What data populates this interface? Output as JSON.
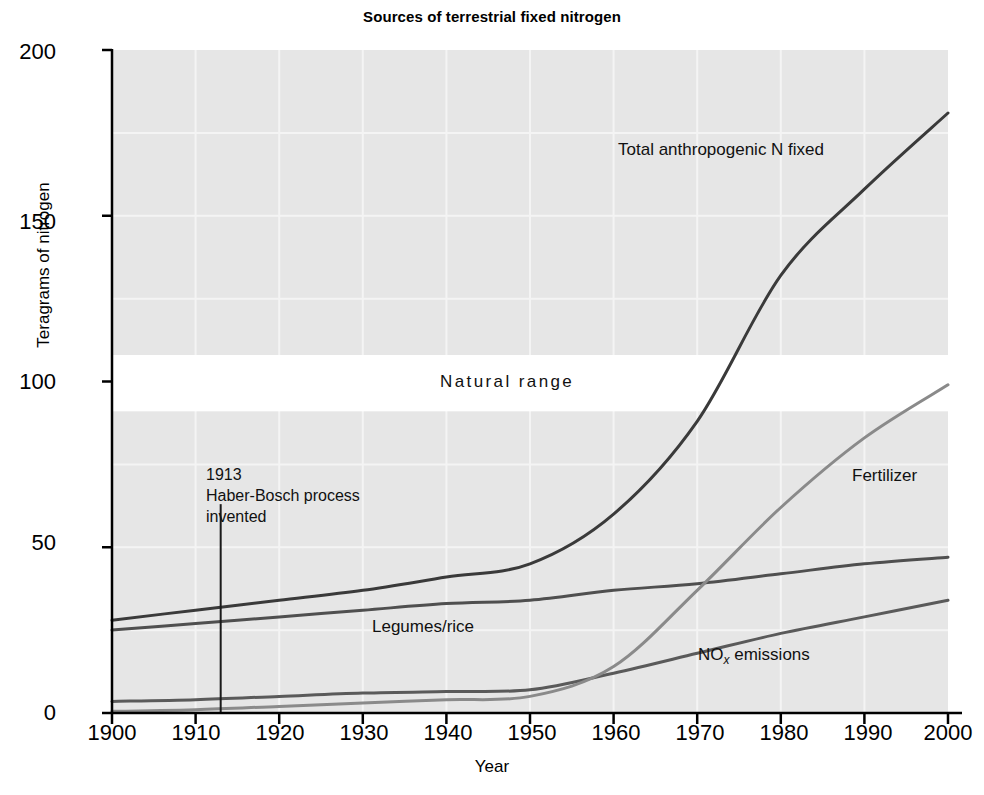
{
  "chart_data": {
    "type": "line",
    "title": "Sources of terrestrial fixed nitrogen",
    "xlabel": "Year",
    "ylabel": "Teragrams of nitrogen",
    "xlim": [
      1900,
      2000
    ],
    "ylim": [
      0,
      200
    ],
    "xticks": [
      "1900",
      "1910",
      "1920",
      "1930",
      "1940",
      "1950",
      "1960",
      "1970",
      "1980",
      "1990",
      "2000"
    ],
    "yticks": [
      "0",
      "50",
      "100",
      "150",
      "200"
    ],
    "grid": "light vertical and horizontal gridlines on gray plot background",
    "legend": "inline labels next to each curve",
    "x": [
      1900,
      1910,
      1920,
      1930,
      1940,
      1950,
      1960,
      1970,
      1980,
      1990,
      2000
    ],
    "series": [
      {
        "name": "Total anthropogenic N fixed",
        "color": "#3a3a3a",
        "values": [
          28,
          31,
          34,
          37,
          41,
          45,
          60,
          88,
          132,
          158,
          181
        ]
      },
      {
        "name": "Legumes/rice",
        "color": "#4f4f4f",
        "values": [
          25,
          27,
          29,
          31,
          33,
          34,
          37,
          39,
          42,
          45,
          47
        ]
      },
      {
        "name": "NOx emissions",
        "color": "#5a5a5a",
        "values": [
          3.5,
          4,
          5,
          6,
          6.5,
          7,
          12,
          18,
          24,
          29,
          34
        ]
      },
      {
        "name": "Fertilizer",
        "color": "#8a8a8a",
        "values": [
          0.5,
          1,
          2,
          3,
          4,
          5,
          14,
          37,
          62,
          83,
          99
        ]
      }
    ],
    "bands": [
      {
        "name": "Natural range",
        "label": "Natural range",
        "y_low": 91,
        "y_high": 108,
        "color": "#ffffff"
      }
    ],
    "annotations": [
      {
        "name": "haber-bosch",
        "year": 1913,
        "lines": [
          "1913",
          "Haber-Bosch process",
          "invented"
        ],
        "line_top_value": 63,
        "line_bottom_value": 0
      }
    ],
    "series_label_positions": [
      {
        "name": "Total anthropogenic N fixed",
        "x": 1963,
        "y": 152
      },
      {
        "name": "Fertilizer",
        "x": 1982,
        "y": 73
      },
      {
        "name": "Legumes/rice",
        "x": 1933,
        "y": 24
      },
      {
        "name": "NOx emissions",
        "x": 1971,
        "y": 15
      }
    ],
    "style": {
      "plot_background": "#e6e6e6",
      "gridline_color": "#f2f2f2",
      "axis_color": "#000000",
      "page_background": "#ffffff"
    }
  },
  "labels": {
    "title": "Sources of terrestrial fixed nitrogen",
    "ylabel": "Teragrams of nitrogen",
    "xlabel": "Year",
    "natural_range": "Natural range",
    "total": "Total anthropogenic N fixed",
    "fertilizer": "Fertilizer",
    "legumes": "Legumes/rice",
    "nox_prefix": "NO",
    "nox_sub": "x",
    "nox_suffix": " emissions",
    "annot_line1": "1913",
    "annot_line2": "Haber-Bosch process",
    "annot_line3": "invented"
  },
  "ticks": {
    "y": [
      "200",
      "150",
      "100",
      "50",
      "0"
    ],
    "x": [
      "1900",
      "1910",
      "1920",
      "1930",
      "1940",
      "1950",
      "1960",
      "1970",
      "1980",
      "1990",
      "2000"
    ]
  }
}
